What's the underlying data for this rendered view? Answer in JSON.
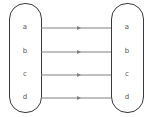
{
  "diagram": {
    "type": "mapping",
    "domain_set": {
      "elements": [
        "a",
        "b",
        "c",
        "d"
      ]
    },
    "codomain_set": {
      "elements": [
        "a",
        "b",
        "c",
        "d"
      ]
    },
    "mappings": [
      {
        "from": "a",
        "to": "a"
      },
      {
        "from": "b",
        "to": "b"
      },
      {
        "from": "c",
        "to": "c"
      },
      {
        "from": "d",
        "to": "d"
      }
    ],
    "colors": {
      "set_border": "#3a3a3a",
      "arrow": "#808080",
      "label": "#555555"
    }
  }
}
